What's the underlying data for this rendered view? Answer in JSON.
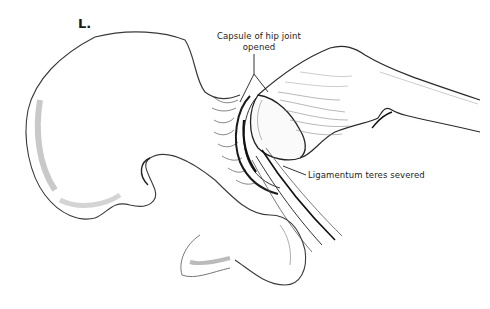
{
  "figure": {
    "panel_label": "L.",
    "labels": {
      "capsule_line1": "Capsule of hip joint",
      "capsule_line2": "opened",
      "ligamentum": "Ligamentum teres severed"
    },
    "colors": {
      "background": "#ffffff",
      "ink": "#1c1c1c",
      "bone_shade": "#bdbdbd"
    }
  }
}
